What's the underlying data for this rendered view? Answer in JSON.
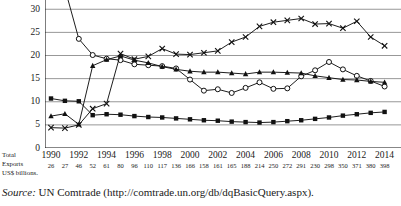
{
  "chart_data": {
    "type": "line",
    "title": "",
    "xlabel": "",
    "ylabel": "% Export Market",
    "ylim": [
      0,
      32
    ],
    "yticks": [
      0,
      5,
      10,
      15,
      20,
      25,
      30
    ],
    "grid": true,
    "legend": "none",
    "x": [
      1990,
      1991,
      1992,
      1993,
      1994,
      1995,
      1996,
      1997,
      1998,
      1999,
      2000,
      2001,
      2002,
      2003,
      2004,
      2005,
      2006,
      2007,
      2008,
      2009,
      2010,
      2011,
      2012,
      2013,
      2014
    ],
    "xtick_labels": [
      "1990",
      "1992",
      "1994",
      "1996",
      "1998",
      "2000",
      "2002",
      "2004",
      "2006",
      "2008",
      "2010",
      "2012",
      "2014"
    ],
    "series": [
      {
        "name": "series-open-circle",
        "marker": "open-circle",
        "values": [
          37.0,
          34.5,
          23.6,
          20.1,
          19.3,
          19.0,
          18.1,
          17.9,
          17.7,
          17.2,
          14.8,
          12.4,
          12.7,
          11.9,
          13.0,
          14.2,
          12.8,
          12.9,
          15.5,
          16.8,
          18.6,
          17.0,
          15.6,
          14.5,
          13.3
        ]
      },
      {
        "name": "series-cross",
        "marker": "cross",
        "values": [
          4.4,
          4.3,
          5.0,
          8.5,
          9.6,
          20.4,
          19.2,
          19.8,
          21.5,
          20.3,
          20.2,
          20.6,
          21.0,
          22.9,
          24.0,
          26.3,
          27.2,
          27.6,
          28.0,
          26.8,
          26.9,
          25.9,
          27.4,
          24.0,
          22.1
        ]
      },
      {
        "name": "series-triangle",
        "marker": "triangle",
        "values": [
          6.9,
          7.4,
          5.1,
          17.8,
          19.1,
          19.9,
          19.0,
          18.4,
          17.6,
          17.0,
          16.6,
          16.4,
          16.4,
          16.2,
          16.0,
          16.4,
          16.4,
          16.3,
          16.2,
          15.6,
          15.2,
          14.8,
          14.7,
          14.4,
          14.2
        ]
      },
      {
        "name": "series-filled-square",
        "marker": "filled-square",
        "values": [
          10.7,
          10.2,
          10.1,
          7.1,
          7.3,
          7.2,
          6.9,
          6.7,
          6.6,
          6.4,
          6.2,
          6.0,
          5.9,
          5.7,
          5.6,
          5.5,
          5.6,
          5.8,
          6.0,
          6.3,
          6.6,
          7.0,
          7.3,
          7.6,
          7.8
        ]
      }
    ],
    "secondary_axis": {
      "label_lines": [
        "Total",
        "Exports",
        "US$ billions."
      ],
      "values": [
        26,
        27,
        46,
        52,
        61,
        80,
        96,
        110,
        117,
        136,
        166,
        158,
        161,
        165,
        188,
        214,
        250,
        272,
        291,
        230,
        298,
        350,
        371,
        380,
        398
      ]
    }
  },
  "source": {
    "prefix": "Source:",
    "text": " UN Comtrade (http://comtrade.un.org/db/dqBasicQuery.aspx)."
  }
}
